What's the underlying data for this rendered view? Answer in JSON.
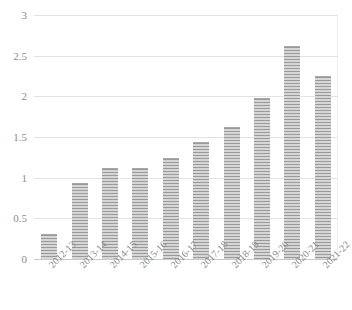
{
  "chart_data": {
    "type": "bar",
    "title": "",
    "subtitle": "",
    "xlabel": "",
    "ylabel": "",
    "categories": [
      "2012-13",
      "2013-14",
      "2014-15",
      "2015-16",
      "2016-17",
      "2017-18",
      "2018-19",
      "2019-20",
      "2020-21",
      "2021-22"
    ],
    "values": [
      0.31,
      0.93,
      1.12,
      1.12,
      1.24,
      1.44,
      1.62,
      1.98,
      2.62,
      2.25
    ],
    "series": [
      {
        "name": "",
        "values": [
          0.31,
          0.93,
          1.12,
          1.12,
          1.24,
          1.44,
          1.62,
          1.98,
          2.62,
          2.25
        ]
      }
    ],
    "ylim": [
      0,
      3
    ],
    "ytick_labels": [
      "0",
      "0.5",
      "1",
      "1.5",
      "2",
      "2.5",
      "3"
    ],
    "ytick_values": [
      0,
      0.5,
      1,
      1.5,
      2,
      2.5,
      3
    ],
    "grid": "horizontal",
    "legend": "none",
    "bar_color": "#bfbfbf",
    "bar_pattern": "horizontal-stripes",
    "gridline_color": "#e2e2e2",
    "axis_color": "#c9c9c9",
    "tick_label_color": "#8d8d8d"
  }
}
